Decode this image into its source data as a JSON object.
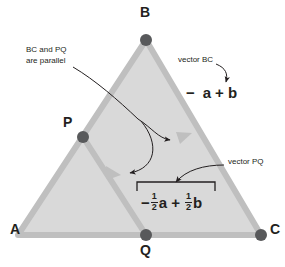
{
  "figure": {
    "kind": "vector-geometry-diagram",
    "colors": {
      "triangle_fill": "#d9d9d9",
      "triangle_edge": "#bfbfbf",
      "point_dot": "#58595b",
      "text": "#231f20",
      "arrow": "#231f20"
    }
  },
  "vertices": [
    {
      "id": "A",
      "label": "A",
      "x": 18,
      "y": 235,
      "label_x": 13,
      "label_y": 228,
      "has_dot": false
    },
    {
      "id": "B",
      "label": "B",
      "x": 146,
      "y": 40,
      "label_x": 140,
      "label_y": 6,
      "has_dot": true
    },
    {
      "id": "C",
      "label": "C",
      "x": 261,
      "y": 235,
      "label_x": 270,
      "label_y": 228,
      "has_dot": true
    }
  ],
  "midpoints": [
    {
      "id": "P",
      "label": "P",
      "x": 83,
      "y": 137,
      "label_x": 64,
      "label_y": 119,
      "has_dot": true
    },
    {
      "id": "Q",
      "label": "Q",
      "x": 146,
      "y": 235,
      "label_x": 140,
      "label_y": 243,
      "has_dot": true
    }
  ],
  "annotations": [
    {
      "name": "parallel-note",
      "text": "BC and PQ\nare parallel",
      "x": 26,
      "y": 47
    },
    {
      "name": "vector-bc-label",
      "text": "vector BC",
      "x": 178,
      "y": 57
    },
    {
      "name": "vector-pq-label",
      "text": "vector PQ",
      "x": 228,
      "y": 158
    }
  ],
  "expressions": [
    {
      "name": "vector-bc-expression",
      "x": 186,
      "y": 89,
      "minus": "−",
      "a": "a",
      "plus": "+",
      "b": "b",
      "display": "− a + b",
      "has_fractions": false,
      "bracket": false
    },
    {
      "name": "vector-pq-expression",
      "x": 140,
      "y": 190,
      "minus": "−",
      "a": "a",
      "plus": "+",
      "b": "b",
      "frac_num": "1",
      "frac_den": "2",
      "display": "− 1/2 a + 1/2 b",
      "has_fractions": true,
      "bracket": true
    }
  ]
}
